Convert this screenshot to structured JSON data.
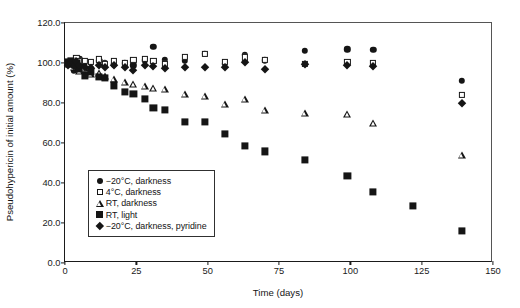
{
  "chart_data": {
    "type": "scatter",
    "title": "",
    "xlabel": "Time (days)",
    "ylabel": "Pseudohypericin of initial amount (%)",
    "xlim": [
      0,
      150
    ],
    "ylim": [
      0,
      120
    ],
    "xticks": [
      "0",
      "25",
      "50",
      "75",
      "100",
      "125",
      "150"
    ],
    "yticks": [
      "0.0",
      "20.0",
      "40.0",
      "60.0",
      "80.0",
      "100.0",
      "120.0"
    ],
    "xtick_values": [
      0,
      25,
      50,
      75,
      100,
      125,
      150
    ],
    "ytick_values": [
      0,
      20,
      40,
      60,
      80,
      100,
      120
    ],
    "grid": false,
    "legend_position": "lower-left-inside",
    "marker_color": "#151515",
    "series": [
      {
        "name": "−20°C, darkness",
        "marker": "filled-circle",
        "points": [
          [
            1,
            99.8
          ],
          [
            2,
            100.6
          ],
          [
            3,
            96.2
          ],
          [
            4,
            101.5
          ],
          [
            5,
            102.0
          ],
          [
            6,
            99.0
          ],
          [
            7,
            100.4
          ],
          [
            9,
            97.5
          ],
          [
            12,
            101.0
          ],
          [
            14,
            100.2
          ],
          [
            17,
            99.4
          ],
          [
            21,
            99.8
          ],
          [
            24,
            98.8
          ],
          [
            28,
            101.3
          ],
          [
            31,
            108.2
          ],
          [
            35,
            101.6
          ],
          [
            42,
            101.0
          ],
          [
            49,
            104.6
          ],
          [
            56,
            99.6
          ],
          [
            63,
            104.0
          ],
          [
            70,
            101.4
          ],
          [
            84,
            106.0
          ],
          [
            99,
            106.8
          ],
          [
            108,
            106.6
          ],
          [
            139,
            91.0
          ]
        ]
      },
      {
        "name": "4°C, darkness",
        "marker": "open-square",
        "points": [
          [
            1,
            100.2
          ],
          [
            2,
            101.2
          ],
          [
            3,
            100.0
          ],
          [
            4,
            102.4
          ],
          [
            5,
            100.8
          ],
          [
            7,
            101.0
          ],
          [
            9,
            100.6
          ],
          [
            12,
            101.8
          ],
          [
            14,
            99.4
          ],
          [
            17,
            101.2
          ],
          [
            21,
            100.0
          ],
          [
            24,
            101.6
          ],
          [
            28,
            102.0
          ],
          [
            31,
            101.0
          ],
          [
            35,
            99.6
          ],
          [
            42,
            103.2
          ],
          [
            49,
            104.4
          ],
          [
            56,
            100.4
          ],
          [
            63,
            102.8
          ],
          [
            70,
            101.4
          ],
          [
            84,
            99.6
          ],
          [
            99,
            100.4
          ],
          [
            108,
            99.8
          ],
          [
            139,
            84.0
          ]
        ]
      },
      {
        "name": "RT, darkness",
        "marker": "open-triangle",
        "points": [
          [
            1,
            99.6
          ],
          [
            2,
            100.4
          ],
          [
            3,
            98.0
          ],
          [
            4,
            100.6
          ],
          [
            5,
            96.0
          ],
          [
            7,
            97.6
          ],
          [
            9,
            94.6
          ],
          [
            12,
            95.0
          ],
          [
            14,
            93.6
          ],
          [
            17,
            92.0
          ],
          [
            21,
            90.6
          ],
          [
            24,
            89.4
          ],
          [
            28,
            88.6
          ],
          [
            31,
            87.6
          ],
          [
            35,
            86.8
          ],
          [
            42,
            84.4
          ],
          [
            49,
            83.6
          ],
          [
            56,
            79.6
          ],
          [
            63,
            81.8
          ],
          [
            70,
            76.6
          ],
          [
            84,
            74.8
          ],
          [
            99,
            74.6
          ],
          [
            108,
            70.2
          ],
          [
            139,
            54.0
          ]
        ]
      },
      {
        "name": "RT, light",
        "marker": "filled-square",
        "points": [
          [
            1,
            100.4
          ],
          [
            2,
            101.0
          ],
          [
            3,
            99.6
          ],
          [
            4,
            100.2
          ],
          [
            5,
            97.2
          ],
          [
            7,
            93.8
          ],
          [
            9,
            95.4
          ],
          [
            12,
            93.2
          ],
          [
            14,
            92.4
          ],
          [
            17,
            88.8
          ],
          [
            21,
            85.6
          ],
          [
            24,
            84.4
          ],
          [
            28,
            82.0
          ],
          [
            31,
            77.4
          ],
          [
            35,
            76.4
          ],
          [
            42,
            70.4
          ],
          [
            49,
            70.4
          ],
          [
            56,
            64.6
          ],
          [
            63,
            58.4
          ],
          [
            70,
            55.8
          ],
          [
            84,
            51.6
          ],
          [
            99,
            43.6
          ],
          [
            108,
            35.6
          ],
          [
            122,
            28.6
          ],
          [
            139,
            16.0
          ]
        ]
      },
      {
        "name": "−20°C, darkness, pyridine",
        "marker": "filled-diamond",
        "points": [
          [
            1,
            99.0
          ],
          [
            2,
            100.2
          ],
          [
            3,
            98.4
          ],
          [
            4,
            100.8
          ],
          [
            5,
            99.2
          ],
          [
            7,
            98.0
          ],
          [
            9,
            97.6
          ],
          [
            12,
            99.0
          ],
          [
            14,
            97.8
          ],
          [
            17,
            99.2
          ],
          [
            21,
            98.0
          ],
          [
            24,
            96.6
          ],
          [
            28,
            99.0
          ],
          [
            31,
            98.4
          ],
          [
            35,
            97.6
          ],
          [
            42,
            98.2
          ],
          [
            49,
            98.0
          ],
          [
            56,
            97.8
          ],
          [
            63,
            100.6
          ],
          [
            70,
            97.2
          ],
          [
            84,
            99.4
          ],
          [
            99,
            99.2
          ],
          [
            108,
            98.6
          ],
          [
            139,
            80.0
          ]
        ]
      }
    ],
    "legend_entries": [
      {
        "label": "−20°C, darkness",
        "marker": "filled-circle"
      },
      {
        "label": "4°C, darkness",
        "marker": "open-square"
      },
      {
        "label": "RT, darkness",
        "marker": "open-triangle"
      },
      {
        "label": "RT, light",
        "marker": "filled-square"
      },
      {
        "label": "−20°C, darkness, pyridine",
        "marker": "filled-diamond"
      }
    ]
  }
}
